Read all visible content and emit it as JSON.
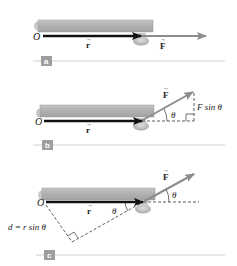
{
  "figure": {
    "panels": [
      {
        "id": "a",
        "badge": "a",
        "origin_label": "O",
        "r_label": "r",
        "f_label": "F"
      },
      {
        "id": "b",
        "badge": "b",
        "origin_label": "O",
        "r_label": "r",
        "f_label": "F",
        "angle_label": "θ",
        "component_label": "F sin θ"
      },
      {
        "id": "c",
        "badge": "c",
        "origin_label": "O",
        "r_label": "r",
        "f_label": "F",
        "angle_label_force": "θ",
        "angle_label_inner": "θ",
        "moment_arm_label": "d = r sin θ"
      }
    ]
  },
  "colors": {
    "bar": "#b3b3b3",
    "bar_edge": "#9a9a9a",
    "r_vector": "#111111",
    "f_vector": "#8c8c8c",
    "badge": "#9e9e9e",
    "rule": "#cfcfcf",
    "dashed": "#333333"
  }
}
